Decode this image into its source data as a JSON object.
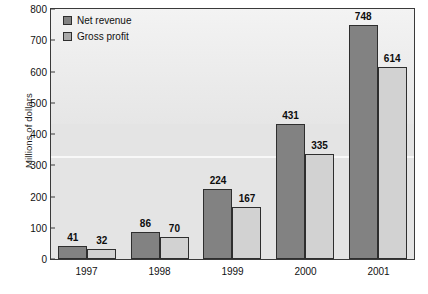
{
  "chart_data": {
    "type": "bar",
    "title": "",
    "subtitle": "",
    "xlabel": "",
    "ylabel": "Millions of dollars",
    "categories": [
      "1997",
      "1998",
      "1999",
      "2000",
      "2001"
    ],
    "series": [
      {
        "name": "Net revenue",
        "color": "#828282",
        "values": [
          41,
          86,
          224,
          431,
          748
        ],
        "labels": [
          "41",
          "86",
          "224",
          "431",
          "748"
        ]
      },
      {
        "name": "Gross profit",
        "color": "#d2d2d2",
        "values": [
          32,
          70,
          167,
          335,
          614
        ],
        "labels": [
          "32",
          "70",
          "167",
          "335",
          "614"
        ]
      }
    ],
    "ylim": [
      0,
      800
    ],
    "ytick_step": 100,
    "yticks": [
      "0",
      "100",
      "200",
      "300",
      "400",
      "500",
      "600",
      "700",
      "800"
    ],
    "grid": false,
    "legend_position": "top-left-inside",
    "bar_label_position": "above",
    "plot_background": "#e4e4e4",
    "page_background": "#ffffff",
    "axis_color": "#3a3a3a"
  },
  "legend": {
    "items": [
      {
        "label": "Net revenue",
        "swatch": "legend-swatch-net-revenue"
      },
      {
        "label": "Gross profit",
        "swatch": "legend-swatch-gross-profit"
      }
    ]
  },
  "axes": {
    "y_title": "Millions of dollars"
  }
}
